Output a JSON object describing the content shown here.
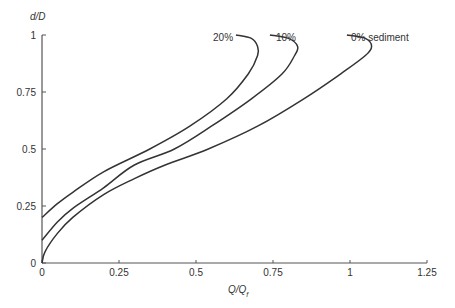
{
  "chart_data": {
    "type": "line",
    "title": "",
    "xlabel": "Q/Qf",
    "xlabel_main": "Q/Q",
    "xlabel_sub": "f",
    "ylabel": "d/D",
    "xlim": [
      0,
      1.25
    ],
    "ylim": [
      0,
      1
    ],
    "xticks": [
      0,
      0.25,
      0.5,
      0.75,
      1,
      1.25
    ],
    "xtick_labels": [
      "0",
      "0.25",
      "0.5",
      "0.75",
      "1",
      "1.25"
    ],
    "yticks": [
      0,
      0.25,
      0.5,
      0.75,
      1
    ],
    "ytick_labels": [
      "0",
      "0.25",
      "0.5",
      "0.75",
      "1"
    ],
    "grid": false,
    "legend": "inline labels at curve tops",
    "series": [
      {
        "name": "0% sediment",
        "label": "0% sediment",
        "points": [
          [
            0,
            0
          ],
          [
            0.01,
            0.05
          ],
          [
            0.05,
            0.13
          ],
          [
            0.1,
            0.2
          ],
          [
            0.2,
            0.3
          ],
          [
            0.3,
            0.37
          ],
          [
            0.4,
            0.43
          ],
          [
            0.54,
            0.5
          ],
          [
            0.7,
            0.6
          ],
          [
            0.85,
            0.72
          ],
          [
            0.97,
            0.83
          ],
          [
            1.05,
            0.91
          ],
          [
            1.07,
            0.95
          ],
          [
            1.05,
            0.985
          ],
          [
            0.99,
            1.0
          ]
        ]
      },
      {
        "name": "10%",
        "label": "10%",
        "points": [
          [
            0,
            0.1
          ],
          [
            0.05,
            0.18
          ],
          [
            0.1,
            0.24
          ],
          [
            0.2,
            0.33
          ],
          [
            0.3,
            0.43
          ],
          [
            0.43,
            0.5
          ],
          [
            0.55,
            0.6
          ],
          [
            0.68,
            0.72
          ],
          [
            0.78,
            0.83
          ],
          [
            0.82,
            0.91
          ],
          [
            0.83,
            0.95
          ],
          [
            0.8,
            0.985
          ],
          [
            0.74,
            1.0
          ]
        ]
      },
      {
        "name": "20%",
        "label": "20%",
        "points": [
          [
            0,
            0.2
          ],
          [
            0.05,
            0.26
          ],
          [
            0.1,
            0.31
          ],
          [
            0.2,
            0.4
          ],
          [
            0.35,
            0.5
          ],
          [
            0.48,
            0.6
          ],
          [
            0.6,
            0.72
          ],
          [
            0.67,
            0.83
          ],
          [
            0.7,
            0.91
          ],
          [
            0.7,
            0.95
          ],
          [
            0.68,
            0.985
          ],
          [
            0.63,
            1.0
          ]
        ]
      }
    ]
  }
}
